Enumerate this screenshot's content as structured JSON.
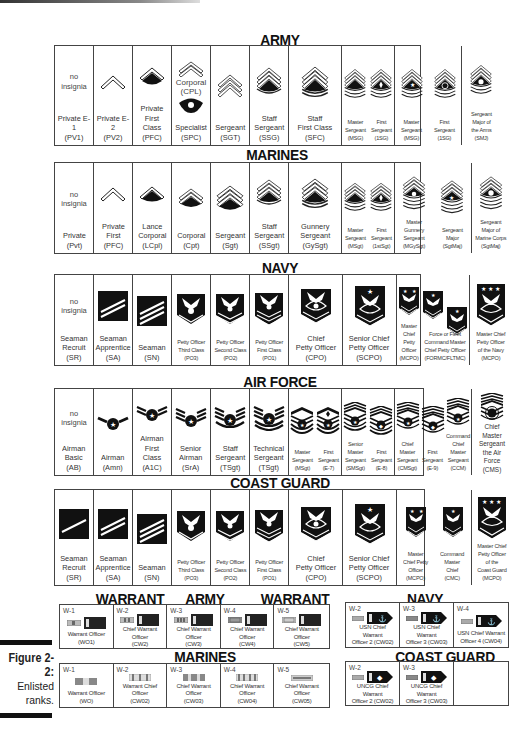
{
  "figure": {
    "label": "Figure 2-2:",
    "caption": "Enlisted\nranks."
  },
  "army": {
    "title": "ARMY",
    "ranks": [
      {
        "insignia": "no-insignia",
        "no_insignia_text": "no\ninsignia",
        "label": "Private E-1\n(PV1)"
      },
      {
        "insignia": "chevron-1",
        "label": "Private E-2\n(PV2)"
      },
      {
        "insignia": "chevron-1-rocker",
        "label": "Private\nFirst Class\n(PFC)"
      },
      {
        "insignia": "specialist-eagle",
        "top_label": "Corporal\n(CPL)",
        "label": "Specialist\n(SPC)"
      },
      {
        "insignia": "chevron-3",
        "label": "Sergeant\n(SGT)"
      },
      {
        "insignia": "chevron-3-rocker-1",
        "label": "Staff\nSergeant\n(SSG)"
      },
      {
        "insignia": "chevron-3-rocker-2",
        "label": "Staff\nFirst Class\n(SFC)"
      },
      {
        "insignia": "chevron-3-rocker-3",
        "label": "Master\nSergeant\n(MSG)"
      },
      {
        "insignia": "chevron-3-rocker-3-diamond",
        "label": "First\nSergeant\n(1SG)"
      },
      {
        "insignia": "chevron-3-rocker-3-star",
        "label": "Master\nSergeant\n(MSG)"
      },
      {
        "insignia": "chevron-3-rocker-3-wreath",
        "label": "First\nSergeant\n(1SG)"
      },
      {
        "insignia": "chevron-3-rocker-3-eagle",
        "label": "Sergeant\nMajor of\nthe Arms\n(SMJ)"
      }
    ]
  },
  "marines": {
    "title": "MARINES",
    "ranks": [
      {
        "insignia": "no-insignia",
        "no_insignia_text": "no\ninsignia",
        "label": "Private\n(Pvt)"
      },
      {
        "insignia": "chevron-1",
        "label": "Private\nFirst\n(PFC)"
      },
      {
        "insignia": "chevron-1-crossed-rifles",
        "label": "Lance\nCorporal\n(LCpl)"
      },
      {
        "insignia": "chevron-2-crossed-rifles",
        "label": "Corporal\n(Cpt)"
      },
      {
        "insignia": "chevron-3-crossed-rifles",
        "label": "Sergeant\n(Sgt)"
      },
      {
        "insignia": "chevron-3-rocker-1-rifles",
        "label": "Staff\nSergeant\n(SSgt)"
      },
      {
        "insignia": "chevron-3-rocker-2-rifles",
        "label": "Gunnery\nSergeant\n(GySgt)"
      },
      {
        "insignia": "chevron-3-rocker-3-rifles",
        "label": "Master\nSergeant\n(MSgt)"
      },
      {
        "insignia": "chevron-3-rocker-3-diamond",
        "label": "First\nSergeant\n(1stSgt)"
      },
      {
        "insignia": "chevron-3-rocker-4-bomb",
        "label": "Master\nGunnery\nSergeant\n(MGySgt)"
      },
      {
        "insignia": "chevron-3-rocker-4-star",
        "label": "Sergeant\nMajor\n(SgtMaj)"
      },
      {
        "insignia": "chevron-3-rocker-4-eagle",
        "label": "Sergeant\nMajor of\nMarine Corps\n(SgtMaj)"
      }
    ]
  },
  "navy": {
    "title": "NAVY",
    "ranks": [
      {
        "insignia": "no-insignia",
        "no_insignia_text": "no\ninsignia",
        "label": "Seaman\nRecruit\n(SR)"
      },
      {
        "insignia": "stripes-2",
        "label": "Seaman\nApprentice\n(SA)"
      },
      {
        "insignia": "stripes-3",
        "label": "Seaman\n(SN)"
      },
      {
        "insignia": "eagle-chevron-1",
        "label": "Petty Officer\nThird Class\n(PO3)"
      },
      {
        "insignia": "eagle-chevron-2",
        "label": "Petty Officer\nSecond Class\n(PO2)"
      },
      {
        "insignia": "eagle-chevron-3",
        "label": "Petty Officer\nFirst Class\n(PO1)"
      },
      {
        "insignia": "eagle-rocker-anchor",
        "label": "Chief\nPetty Officer\n(CPO)"
      },
      {
        "insignia": "eagle-rocker-anchor-star",
        "label": "Senior Chief\nPetty Officer\n(SCPO)"
      },
      {
        "insignia": "eagle-rocker-2-stars",
        "label": "Master\nChief Petty\nOfficer\n(MCPO)"
      },
      {
        "insignia": "eagle-rocker-star-a",
        "label": "Force or Fleet\nCommand Master\nChief Petty Officer\n(FORMC/FLTMC)"
      },
      {
        "insignia": "eagle-rocker-star-b",
        "label": ""
      },
      {
        "insignia": "eagle-rocker-3-stars",
        "label": "Master Chief\nPetty Officer\nof the Navy\n(MCPO)"
      }
    ]
  },
  "air_force": {
    "title": "AIR FORCE",
    "ranks": [
      {
        "insignia": "no-insignia",
        "no_insignia_text": "no\ninsignia",
        "label": "Airman\nBasic\n(AB)"
      },
      {
        "insignia": "af-stripes-1",
        "label": "Airman\n(Amn)"
      },
      {
        "insignia": "af-stripes-2",
        "label": "Airman\nFirst Class\n(A1C)"
      },
      {
        "insignia": "af-stripes-3",
        "label": "Senior\nAirman\n(SrA)"
      },
      {
        "insignia": "af-stripes-4",
        "label": "Staff\nSergeant\n(TSgt)"
      },
      {
        "insignia": "af-stripes-5",
        "label": "Technical\nSergeant\n(TSgt)"
      },
      {
        "insignia": "af-top-1",
        "label": "Master\nSergeant\n(MSgt)"
      },
      {
        "insignia": "af-top-1-diamond",
        "label": "First\nSergeant\n(E-7)"
      },
      {
        "insignia": "af-top-2",
        "label": "Senior\nMaster\nSergeant\n(SMSgt)"
      },
      {
        "insignia": "af-top-2-diamond",
        "label": "First\nSergeant\n(E-8)"
      },
      {
        "insignia": "af-top-3",
        "label": "Chief\nMaster\nSergeant\n(CMSgt)"
      },
      {
        "insignia": "af-top-3-diamond",
        "label": "First\nSergeant\n(E-9)"
      },
      {
        "insignia": "af-top-3-star",
        "label": "Command\nChief Master\nSergeant\n(CCM)"
      },
      {
        "insignia": "af-top-3-wreath",
        "label": "Chief Master\nSergeant\nthe Air Force\n(CMS)"
      }
    ]
  },
  "coast_guard": {
    "title": "COAST GUARD",
    "ranks": [
      {
        "insignia": "stripes-1",
        "label": "Seaman\nRecruit\n(SR)"
      },
      {
        "insignia": "stripes-2",
        "label": "Seaman\nApprentice\n(SA)"
      },
      {
        "insignia": "stripes-3",
        "label": "Seaman\n(SN)"
      },
      {
        "insignia": "eagle-chevron-1",
        "label": "Petty Officer\nThird Class\n(PO3)"
      },
      {
        "insignia": "eagle-chevron-2",
        "label": "Petty Officer\nSecond Class\n(PO2)"
      },
      {
        "insignia": "eagle-chevron-3",
        "label": "Petty Officer\nFirst Class\n(PO1)"
      },
      {
        "insignia": "eagle-rocker-anchor",
        "label": "Chief\nPetty Officer\n(CPO)"
      },
      {
        "insignia": "eagle-rocker-anchor-star",
        "label": "Senior Chief\nPetty Officer\n(SCPO)"
      },
      {
        "insignia": "eagle-rocker-2-stars",
        "label": "Master\nChief Petty\nOfficer\n(MCPO)"
      },
      {
        "insignia": "eagle-rocker-star",
        "label": "Command\nMaster\nChief\n(CMC)"
      },
      {
        "insignia": "eagle-rocker-3-stars",
        "label": "Master Chief\nPetty Officer\nof the\nCoast Guard\n(MCPO)"
      }
    ]
  },
  "warrant": {
    "army": {
      "title_left": "WARRANT",
      "title_right": "ARMY",
      "ranks": [
        {
          "grade": "W-1",
          "label": "Warrant Officer\n(WO1)"
        },
        {
          "grade": "W-2",
          "label": "Chief Warrant Officer\n(CW2)"
        },
        {
          "grade": "W-3",
          "label": "Chief Warrant Officer\n(CW3)"
        },
        {
          "grade": "W-4",
          "label": "Chief Warrant Officer\n(CW4)"
        },
        {
          "grade": "W-5",
          "label": "Chief Warrant Officer\n(CW5)"
        }
      ]
    },
    "navy": {
      "title_left": "WARRANT",
      "title_right": "NAVY",
      "ranks": [
        {
          "grade": "W-2",
          "label": "USN Chief Warrant\nOfficer 2  (CW02)"
        },
        {
          "grade": "W-3",
          "label": "USN Chief Warrant\nOfficer 3  (CW03)"
        },
        {
          "grade": "W-4",
          "label": "USN Chief Warrant\nOfficer 4  (CW04)"
        }
      ]
    },
    "marines": {
      "title": "MARINES",
      "ranks": [
        {
          "grade": "W-1",
          "label": "Warrant Officer\n(WO)"
        },
        {
          "grade": "W-2",
          "label": "Warrant Chief Officer\n(CW02)"
        },
        {
          "grade": "W-3",
          "label": "Chief Warrant Officer\n(CW03)"
        },
        {
          "grade": "W-4",
          "label": "Chief Warrant Officer\n(CW04)"
        },
        {
          "grade": "W-5",
          "label": "Chief Warrant Officer\n(CW05)"
        }
      ]
    },
    "coast_guard": {
      "title": "COAST GUARD",
      "ranks": [
        {
          "grade": "W-2",
          "label": "UNCG Chief Warrant\nOfficer 2  (CW02)"
        },
        {
          "grade": "W-3",
          "label": "UNCG Chief Warrant\nOfficer 3  (CW03)"
        }
      ]
    }
  },
  "colors": {
    "ink": "#111111",
    "border": "#444444",
    "text": "#333333",
    "paper": "#ffffff"
  }
}
